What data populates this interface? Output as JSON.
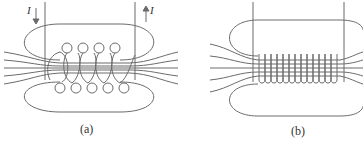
{
  "figure": {
    "panels": [
      {
        "id": "a",
        "caption": "(a)",
        "description": "Loosely wound solenoid with cross-sections of wire loops and magnetic field lines",
        "current_label_in": "I",
        "current_label_out": "I",
        "top_loops": 4,
        "bottom_loops": 5
      },
      {
        "id": "b",
        "caption": "(b)",
        "description": "Tightly wound solenoid with uniform field inside",
        "turns": 13
      }
    ],
    "colors": {
      "line": "#6b6b6b",
      "text": "#333333",
      "background": "#ffffff"
    }
  }
}
